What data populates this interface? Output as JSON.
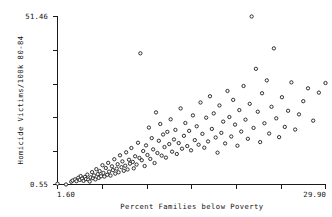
{
  "chart_data": {
    "type": "scatter",
    "title": "",
    "xlabel": "Percent Families below Poverty",
    "ylabel": "Homicide Victims/100k 80-84",
    "xlim": [
      1.6,
      29.9
    ],
    "ylim": [
      0.55,
      51.46
    ],
    "grid": false,
    "legend": null,
    "xtick_labels": [
      "1.60",
      "29.90"
    ],
    "ytick_labels": [
      "0.55",
      "51.46"
    ],
    "xticks_unlabeled_count": 5,
    "yticks_unlabeled_count": 4,
    "marker": "open-circle",
    "marker_color": "#1c1c1c",
    "points": [
      [
        1.6,
        0.8
      ],
      [
        2.5,
        0.55
      ],
      [
        3.05,
        1.4
      ],
      [
        3.2,
        1.75
      ],
      [
        3.45,
        2.1
      ],
      [
        3.6,
        1.55
      ],
      [
        3.8,
        2.6
      ],
      [
        3.95,
        1.95
      ],
      [
        4.05,
        3.1
      ],
      [
        4.2,
        2.35
      ],
      [
        4.35,
        1.65
      ],
      [
        4.5,
        2.85
      ],
      [
        4.6,
        2.2
      ],
      [
        4.75,
        3.55
      ],
      [
        4.85,
        2.05
      ],
      [
        5.0,
        1.45
      ],
      [
        5.1,
        2.7
      ],
      [
        5.25,
        4.3
      ],
      [
        5.35,
        2.45
      ],
      [
        5.45,
        3.3
      ],
      [
        5.6,
        2.1
      ],
      [
        5.7,
        5.2
      ],
      [
        5.85,
        3.7
      ],
      [
        5.95,
        2.55
      ],
      [
        6.05,
        4.6
      ],
      [
        6.2,
        3.05
      ],
      [
        6.35,
        6.4
      ],
      [
        6.45,
        4.05
      ],
      [
        6.55,
        2.95
      ],
      [
        6.7,
        5.55
      ],
      [
        6.85,
        3.5
      ],
      [
        6.95,
        7.1
      ],
      [
        7.05,
        4.45
      ],
      [
        7.2,
        3.25
      ],
      [
        7.35,
        6.05
      ],
      [
        7.45,
        4.9
      ],
      [
        7.6,
        8.2
      ],
      [
        7.7,
        3.85
      ],
      [
        7.85,
        5.35
      ],
      [
        7.95,
        6.7
      ],
      [
        8.05,
        4.25
      ],
      [
        8.2,
        9.4
      ],
      [
        8.35,
        5.8
      ],
      [
        8.45,
        7.55
      ],
      [
        8.6,
        4.7
      ],
      [
        8.75,
        6.25
      ],
      [
        8.85,
        10.3
      ],
      [
        9.0,
        5.1
      ],
      [
        9.15,
        8.05
      ],
      [
        9.25,
        6.85
      ],
      [
        9.4,
        11.6
      ],
      [
        9.55,
        7.4
      ],
      [
        9.65,
        5.45
      ],
      [
        9.8,
        9.1
      ],
      [
        9.95,
        6.6
      ],
      [
        10.1,
        13.2
      ],
      [
        10.25,
        8.6
      ],
      [
        10.35,
        40.3
      ],
      [
        10.5,
        7.9
      ],
      [
        10.65,
        10.7
      ],
      [
        10.8,
        6.15
      ],
      [
        10.95,
        12.4
      ],
      [
        11.1,
        9.5
      ],
      [
        11.25,
        17.8
      ],
      [
        11.4,
        8.3
      ],
      [
        11.55,
        14.6
      ],
      [
        11.7,
        11.2
      ],
      [
        11.85,
        7.05
      ],
      [
        12.0,
        22.4
      ],
      [
        12.15,
        10.1
      ],
      [
        12.3,
        13.8
      ],
      [
        12.45,
        18.9
      ],
      [
        12.6,
        9.3
      ],
      [
        12.75,
        15.7
      ],
      [
        12.9,
        11.9
      ],
      [
        13.05,
        8.7
      ],
      [
        13.2,
        16.5
      ],
      [
        13.4,
        12.8
      ],
      [
        13.55,
        20.3
      ],
      [
        13.7,
        10.5
      ],
      [
        13.9,
        14.2
      ],
      [
        14.05,
        17.1
      ],
      [
        14.2,
        9.8
      ],
      [
        14.4,
        13.1
      ],
      [
        14.6,
        23.6
      ],
      [
        14.75,
        11.4
      ],
      [
        14.95,
        15.3
      ],
      [
        15.1,
        19.2
      ],
      [
        15.3,
        12.2
      ],
      [
        15.5,
        16.8
      ],
      [
        15.7,
        10.9
      ],
      [
        15.9,
        21.5
      ],
      [
        16.1,
        14.0
      ],
      [
        16.3,
        18.2
      ],
      [
        16.5,
        12.6
      ],
      [
        16.7,
        25.4
      ],
      [
        16.9,
        15.9
      ],
      [
        17.1,
        11.7
      ],
      [
        17.3,
        20.8
      ],
      [
        17.5,
        13.6
      ],
      [
        17.7,
        27.3
      ],
      [
        17.9,
        17.4
      ],
      [
        18.1,
        22.1
      ],
      [
        18.3,
        14.8
      ],
      [
        18.5,
        10.2
      ],
      [
        18.7,
        24.5
      ],
      [
        18.9,
        16.2
      ],
      [
        19.1,
        19.6
      ],
      [
        19.3,
        13.0
      ],
      [
        19.55,
        28.9
      ],
      [
        19.75,
        21.0
      ],
      [
        19.95,
        15.1
      ],
      [
        20.15,
        26.2
      ],
      [
        20.35,
        18.7
      ],
      [
        20.6,
        12.3
      ],
      [
        20.8,
        23.1
      ],
      [
        21.0,
        16.6
      ],
      [
        21.25,
        30.4
      ],
      [
        21.45,
        20.2
      ],
      [
        21.7,
        14.4
      ],
      [
        21.9,
        25.0
      ],
      [
        22.1,
        51.46
      ],
      [
        22.3,
        17.7
      ],
      [
        22.55,
        35.6
      ],
      [
        22.75,
        22.6
      ],
      [
        23.0,
        13.4
      ],
      [
        23.2,
        28.2
      ],
      [
        23.45,
        19.1
      ],
      [
        23.7,
        32.1
      ],
      [
        23.95,
        16.0
      ],
      [
        24.2,
        24.1
      ],
      [
        24.45,
        41.8
      ],
      [
        24.7,
        20.6
      ],
      [
        25.0,
        14.9
      ],
      [
        25.3,
        27.0
      ],
      [
        25.6,
        18.0
      ],
      [
        25.95,
        22.9
      ],
      [
        26.3,
        31.5
      ],
      [
        26.7,
        17.2
      ],
      [
        27.1,
        21.8
      ],
      [
        27.55,
        25.8
      ],
      [
        28.05,
        29.7
      ],
      [
        28.6,
        19.9
      ],
      [
        29.2,
        28.4
      ],
      [
        29.9,
        31.3
      ]
    ]
  }
}
